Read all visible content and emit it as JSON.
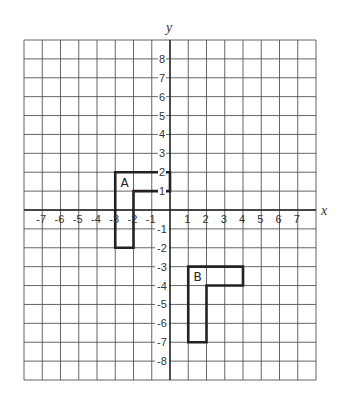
{
  "diagram": {
    "type": "coordinate-grid",
    "axes": {
      "x_label": "x",
      "y_label": "y",
      "x_range": [
        -8,
        8
      ],
      "y_range": [
        -9,
        9
      ],
      "x_ticks": [
        -7,
        -6,
        -5,
        -4,
        -3,
        -2,
        -1,
        1,
        2,
        3,
        4,
        5,
        6,
        7
      ],
      "y_ticks": [
        8,
        7,
        6,
        5,
        4,
        3,
        2,
        1,
        -1,
        -2,
        -3,
        -4,
        -5,
        -6,
        -7,
        -8
      ]
    },
    "shapes": [
      {
        "label": "A",
        "vertices": [
          [
            -3,
            2
          ],
          [
            0,
            2
          ],
          [
            0,
            1
          ],
          [
            -2,
            1
          ],
          [
            -2,
            -2
          ],
          [
            -3,
            -2
          ]
        ],
        "label_position": [
          -2.5,
          1.5
        ]
      },
      {
        "label": "B",
        "vertices": [
          [
            1,
            -3
          ],
          [
            4,
            -3
          ],
          [
            4,
            -4
          ],
          [
            2,
            -4
          ],
          [
            2,
            -7
          ],
          [
            1,
            -7
          ]
        ],
        "label_position": [
          1.5,
          -3.5
        ]
      }
    ]
  },
  "colors": {
    "grid": "#555555",
    "axis": "#222222",
    "shape_stroke": "#222222",
    "text": "#333333",
    "background": "#ffffff"
  }
}
